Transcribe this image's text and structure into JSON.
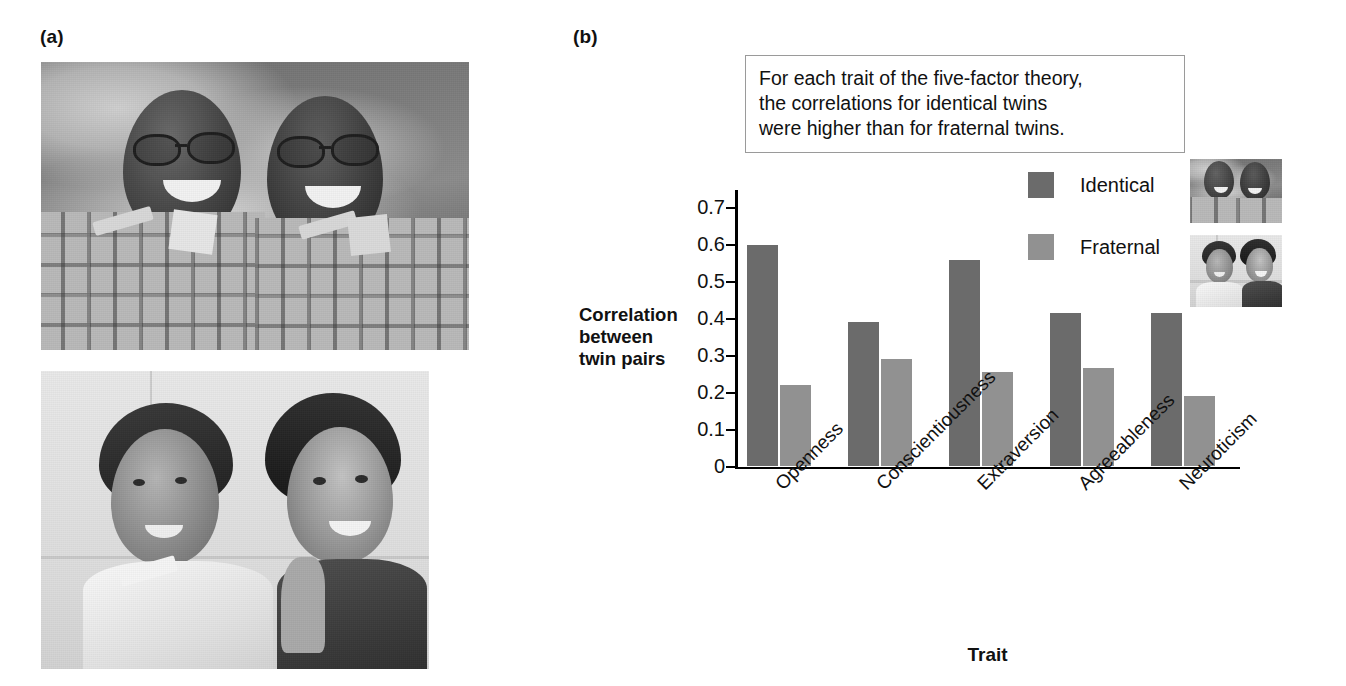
{
  "panels": {
    "a": {
      "label": "(a)",
      "photos": [
        {
          "name": "identical-twins-photo",
          "alt": "Two smiling identical twin men wearing plaid shirts outdoors against a cloudy sky"
        },
        {
          "name": "fraternal-twins-photo",
          "alt": "A smiling young man and young woman standing back to back indoors"
        }
      ]
    },
    "b": {
      "label": "(b)",
      "caption": [
        "For each trait of the five-factor theory,",
        "the correlations for identical twins",
        "were higher than for fraternal twins."
      ],
      "legend_thumbnails": [
        {
          "name": "legend-thumb-identical",
          "alt": "Identical twin men"
        },
        {
          "name": "legend-thumb-fraternal",
          "alt": "Fraternal twin man and woman"
        }
      ]
    }
  },
  "chart_data": {
    "type": "bar",
    "title": "",
    "xlabel": "Trait",
    "ylabel": "Correlation between twin pairs",
    "categories": [
      "Openness",
      "Conscientiousness",
      "Extraversion",
      "Agreeableness",
      "Neuroticism"
    ],
    "series": [
      {
        "name": "Identical",
        "color": "#6b6b6b",
        "values": [
          0.6,
          0.39,
          0.56,
          0.415,
          0.415
        ]
      },
      {
        "name": "Fraternal",
        "color": "#919191",
        "values": [
          0.22,
          0.29,
          0.255,
          0.265,
          0.19
        ]
      }
    ],
    "ylim": [
      0,
      0.75
    ],
    "yticks": [
      0,
      0.1,
      0.2,
      0.3,
      0.4,
      0.5,
      0.6,
      0.7
    ],
    "ytick_labels": [
      "0",
      "0.1",
      "0.2",
      "0.3",
      "0.4",
      "0.5",
      "0.6",
      "0.7"
    ],
    "grid": false,
    "legend_position": "upper-right",
    "xtick_rotation": -45
  },
  "colors": {
    "identical": "#6b6b6b",
    "fraternal": "#919191",
    "axis": "#000000",
    "caption_border": "#9a9a9a",
    "text": "#111111",
    "background": "#ffffff"
  }
}
